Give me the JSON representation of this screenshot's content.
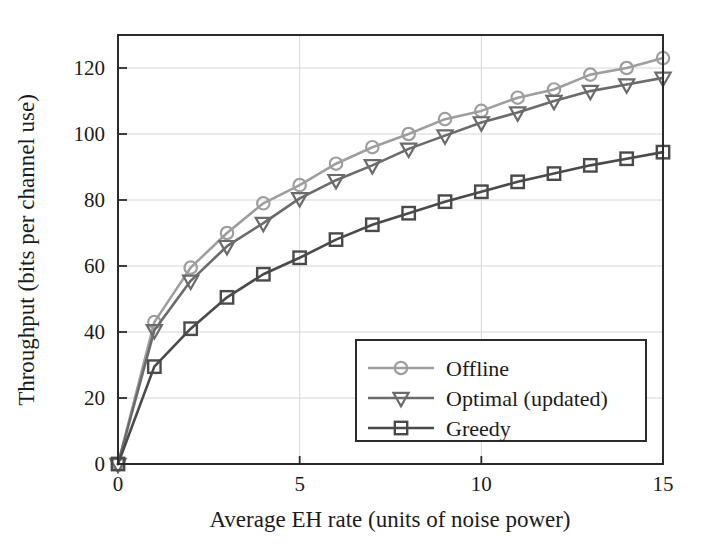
{
  "chart_data": {
    "type": "line",
    "title": "",
    "xlabel": "Average EH rate (units of noise power)",
    "ylabel": "Throughput (bits per channel use)",
    "xlim": [
      0,
      15
    ],
    "ylim": [
      0,
      130
    ],
    "xticks": [
      0,
      5,
      10,
      15
    ],
    "xtick_labels": [
      "0",
      "5",
      "10",
      "15"
    ],
    "yticks": [
      0,
      20,
      40,
      60,
      80,
      100,
      120
    ],
    "ytick_labels": [
      "0",
      "20",
      "40",
      "60",
      "80",
      "100",
      "120"
    ],
    "grid": true,
    "grid_axis": "y",
    "legend_position": "lower right",
    "x": [
      0,
      1,
      2,
      3,
      4,
      5,
      6,
      7,
      8,
      9,
      10,
      11,
      12,
      13,
      14,
      15
    ],
    "series": [
      {
        "name": "Offline",
        "marker": "circle",
        "color": "#9e9e9e",
        "values": [
          0,
          43,
          59.5,
          70,
          79,
          84.5,
          91,
          96,
          100,
          104.5,
          107,
          111,
          113.5,
          118,
          120,
          123
        ]
      },
      {
        "name": "Optimal (updated)",
        "marker": "triangle-down",
        "color": "#6b6b6b",
        "values": [
          0,
          40.5,
          55.5,
          66,
          73,
          80.5,
          86,
          90.5,
          95.5,
          99.5,
          103.5,
          106.5,
          110,
          113,
          115,
          117
        ]
      },
      {
        "name": "Greedy",
        "marker": "square",
        "color": "#4a4a4a",
        "values": [
          0,
          29.5,
          41,
          50.5,
          57.5,
          62.5,
          68,
          72.5,
          76,
          79.5,
          82.5,
          85.5,
          88,
          90.5,
          92.5,
          94.5
        ]
      }
    ]
  },
  "legend": {
    "entries": [
      {
        "label": "Offline"
      },
      {
        "label": "Optimal (updated)"
      },
      {
        "label": "Greedy"
      }
    ]
  },
  "axes": {
    "x_title": "Average EH rate (units of noise power)",
    "y_title": "Throughput (bits per channel use)"
  },
  "colors": {
    "offline": "#9e9e9e",
    "optimal": "#6b6b6b",
    "greedy": "#4a4a4a",
    "axis": "#2b2b2b",
    "grid": "#d6d6d6",
    "background": "#ffffff"
  }
}
